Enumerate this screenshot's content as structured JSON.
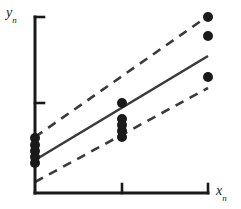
{
  "figure": {
    "kind": "scatter-with-regression",
    "background_color": "#ffffff",
    "ink_color": "#1a1a1a"
  },
  "axes": {
    "y_label": "y",
    "y_label_sub": "n",
    "x_label": "x",
    "x_label_sub": "n",
    "x_axis": {
      "y_px": 193,
      "x_start_px": 35,
      "x_end_px": 208
    },
    "y_axis": {
      "x_px": 35,
      "y_start_px": 17,
      "y_end_px": 193
    },
    "x_ticks_px": [
      122,
      208
    ],
    "y_ticks_px": [
      17,
      103
    ],
    "tick_length_px": 9,
    "axis_stroke_width": 3,
    "tick_stroke_width": 2.6
  },
  "chart_data": {
    "type": "scatter",
    "title": "",
    "xlabel": "x_n",
    "ylabel": "y_n",
    "xlim": [
      0,
      1
    ],
    "ylim": [
      0,
      1
    ],
    "grid": false,
    "legend": null,
    "series": [
      {
        "name": "observations",
        "marker": "filled-circle",
        "color": "#1a1a1a",
        "marker_radius_px": 5,
        "points_px": [
          [
            35,
            138
          ],
          [
            35,
            145
          ],
          [
            35,
            151
          ],
          [
            35,
            157
          ],
          [
            35,
            163
          ],
          [
            122,
            103
          ],
          [
            122,
            119
          ],
          [
            122,
            125
          ],
          [
            122,
            131
          ],
          [
            122,
            137
          ],
          [
            208,
            17
          ],
          [
            208,
            36
          ],
          [
            208,
            77
          ]
        ]
      }
    ],
    "lines": [
      {
        "name": "fit-line",
        "style": "solid",
        "color": "#3a3a3a",
        "stroke_width": 2.6,
        "from_px": [
          35,
          160
        ],
        "to_px": [
          208,
          56
        ]
      },
      {
        "name": "upper-band",
        "style": "dashed",
        "color": "#3a3a3a",
        "stroke_width": 2.6,
        "dash_pattern": "9 7",
        "from_px": [
          35,
          137
        ],
        "to_px": [
          208,
          16
        ]
      },
      {
        "name": "lower-band",
        "style": "dashed",
        "color": "#3a3a3a",
        "stroke_width": 2.6,
        "dash_pattern": "9 7",
        "from_px": [
          35,
          182
        ],
        "to_px": [
          208,
          88
        ]
      }
    ]
  }
}
